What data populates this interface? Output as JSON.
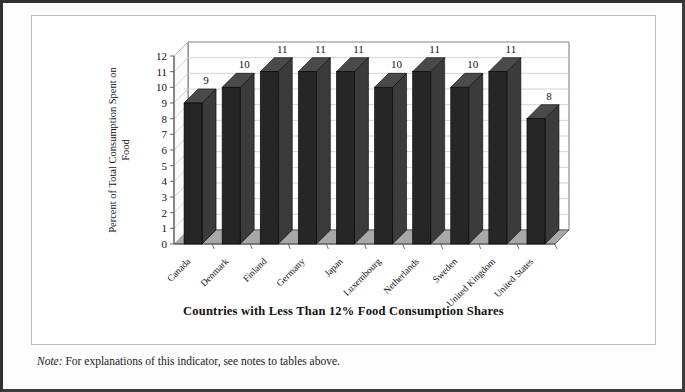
{
  "note": {
    "prefix": "Note:",
    "text": " For explanations of this indicator, see notes to tables above."
  },
  "colors": {
    "bar_front": "#262626",
    "bar_side": "#3b3b3b",
    "bar_top": "#4a4a4a",
    "floor": "#a8a8a8",
    "back_wall": "#ffffff",
    "gridline": "#c9c9c9",
    "axis": "#555555",
    "frame": "#b9bcc0",
    "page_border": "#2f3133",
    "text": "#111111"
  },
  "chart_data": {
    "type": "bar",
    "title": "",
    "subtitle": "",
    "xlabel": "Countries with Less Than 12% Food Consumption Shares",
    "ylabel": "Percent of Total Consumption Spent on Food",
    "ylabel_line1": "Percent of Total Consumption Spent on",
    "ylabel_line2": "Food",
    "categories": [
      "Canada",
      "Denmark",
      "Finland",
      "Germany",
      "Japan",
      "Luxembourg",
      "Netherlands",
      "Sweden",
      "United Kingdom",
      "United States"
    ],
    "values": [
      9,
      10,
      11,
      11,
      11,
      10,
      11,
      10,
      11,
      8
    ],
    "data_labels": [
      "9",
      "10",
      "11",
      "11",
      "11",
      "10",
      "11",
      "10",
      "11",
      "8"
    ],
    "ylim": [
      0,
      12
    ],
    "ytick_step": 1,
    "ytick_labels": [
      "0",
      "1",
      "2",
      "3",
      "4",
      "5",
      "6",
      "7",
      "8",
      "9",
      "10",
      "11",
      "12"
    ],
    "grid": true,
    "grid_axis": "y",
    "legend": "none",
    "three_d": true,
    "label_rotation_deg": -45
  }
}
